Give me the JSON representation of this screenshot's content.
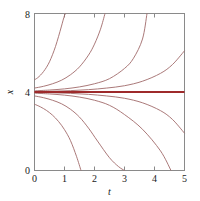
{
  "figure": {
    "background_color": "#ffffff",
    "frame_color": "#8a8a8a"
  },
  "chart_data": {
    "type": "line",
    "title": "",
    "subtitle": "",
    "xlabel": "t",
    "ylabel": "x",
    "xlim": [
      0,
      5
    ],
    "ylim": [
      0,
      8
    ],
    "xticks": [
      0,
      1,
      2,
      3,
      4,
      5
    ],
    "yticks": [
      0,
      4,
      8
    ],
    "xticklabels": [
      "0",
      "1",
      "2",
      "3",
      "4",
      "5"
    ],
    "yticklabels": [
      "0",
      "4",
      "8"
    ],
    "grid": false,
    "legend": null,
    "annotations": [],
    "equilibrium": {
      "name": "unstable-equilibrium-x-equals-4",
      "value": 4,
      "color": "#9e2a2b",
      "orientation": "horizontal"
    },
    "curve_color": "#a06a6a",
    "series": [
      {
        "name": "curve-above-1",
        "color": "#a06a6a",
        "x": [
          0,
          0.1,
          0.2,
          0.3,
          0.4,
          0.5,
          0.6,
          0.7,
          0.8,
          0.9,
          1.0,
          1.05
        ],
        "y": [
          4.62,
          4.72,
          4.86,
          5.04,
          5.26,
          5.54,
          5.9,
          6.32,
          6.82,
          7.36,
          7.9,
          8.0
        ]
      },
      {
        "name": "curve-above-2",
        "color": "#a06a6a",
        "x": [
          0,
          0.3,
          0.6,
          0.9,
          1.2,
          1.5,
          1.8,
          2.0,
          2.2,
          2.35
        ],
        "y": [
          4.2,
          4.29,
          4.42,
          4.6,
          4.88,
          5.28,
          5.88,
          6.44,
          7.2,
          8.0
        ]
      },
      {
        "name": "curve-above-3",
        "color": "#a06a6a",
        "x": [
          0,
          0.5,
          1.0,
          1.5,
          2.0,
          2.5,
          3.0,
          3.3,
          3.6,
          3.75
        ],
        "y": [
          4.06,
          4.1,
          4.16,
          4.26,
          4.42,
          4.68,
          5.2,
          5.72,
          6.7,
          8.0
        ]
      },
      {
        "name": "curve-above-4",
        "color": "#a06a6a",
        "x": [
          0,
          0.6,
          1.2,
          1.8,
          2.4,
          3.0,
          3.6,
          4.2,
          4.6,
          5.0
        ],
        "y": [
          4.02,
          4.04,
          4.07,
          4.12,
          4.2,
          4.32,
          4.55,
          4.95,
          5.4,
          6.1
        ]
      },
      {
        "name": "curve-below-1",
        "color": "#a06a6a",
        "x": [
          0,
          0.6,
          1.2,
          1.8,
          2.4,
          3.0,
          3.6,
          4.2,
          4.6,
          5.0
        ],
        "y": [
          3.98,
          3.96,
          3.93,
          3.88,
          3.8,
          3.68,
          3.45,
          3.05,
          2.6,
          1.9
        ]
      },
      {
        "name": "curve-below-2",
        "color": "#a06a6a",
        "x": [
          0,
          0.5,
          1.0,
          1.5,
          2.0,
          2.5,
          3.0,
          3.6,
          4.2,
          4.55
        ],
        "y": [
          3.94,
          3.9,
          3.84,
          3.74,
          3.58,
          3.32,
          2.85,
          2.1,
          1.0,
          0.0
        ]
      },
      {
        "name": "curve-below-3",
        "color": "#a06a6a",
        "x": [
          0,
          0.3,
          0.6,
          0.9,
          1.2,
          1.5,
          1.8,
          2.1,
          2.5,
          2.8,
          3.0
        ],
        "y": [
          3.8,
          3.71,
          3.58,
          3.4,
          3.12,
          2.72,
          2.16,
          1.5,
          0.65,
          0.2,
          0.0
        ]
      },
      {
        "name": "curve-below-4",
        "color": "#a06a6a",
        "x": [
          0,
          0.2,
          0.4,
          0.6,
          0.8,
          1.0,
          1.2,
          1.4,
          1.55
        ],
        "y": [
          3.38,
          3.24,
          3.06,
          2.82,
          2.5,
          2.08,
          1.52,
          0.72,
          0.0
        ]
      },
      {
        "name": "equilibrium-line",
        "color": "#9e2a2b",
        "x": [
          0,
          5
        ],
        "y": [
          4,
          4
        ]
      }
    ]
  }
}
